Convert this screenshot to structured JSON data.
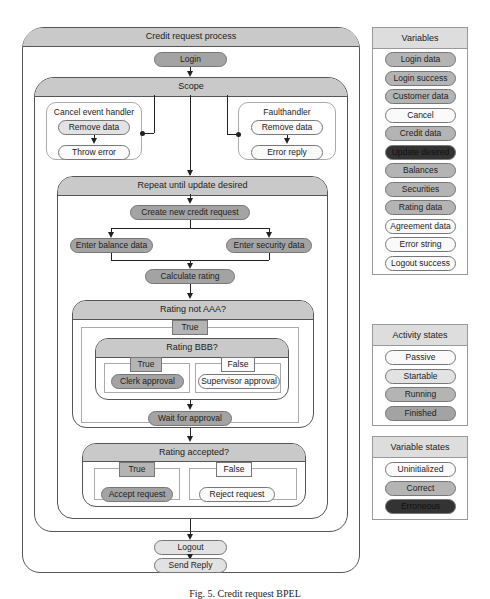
{
  "process": {
    "title": "Credit request process",
    "login": "Login",
    "scope": {
      "title": "Scope",
      "cancel_handler": {
        "title": "Cancel event handler",
        "steps": [
          "Remove data",
          "Throw error"
        ]
      },
      "fault_handler": {
        "title": "Faulthandler",
        "steps": [
          "Remove data",
          "Error reply"
        ]
      },
      "repeat": {
        "title": "Repeat until update desired",
        "create": "Create new credit request",
        "enter_balance": "Enter balance data",
        "enter_security": "Enter security data",
        "calculate": "Calculate rating",
        "rating_not_aaa": {
          "title": "Rating not AAA?",
          "true_label": "True",
          "rating_bbb": {
            "title": "Rating BBB?",
            "true_label": "True",
            "false_label": "False",
            "true_activity": "Clerk approval",
            "false_activity": "Supervisor approval"
          },
          "wait": "Wait for approval"
        },
        "rating_accepted": {
          "title": "Rating accepted?",
          "true_label": "True",
          "false_label": "False",
          "true_activity": "Accept request",
          "false_activity": "Reject request"
        }
      }
    },
    "logout": "Logout",
    "send_reply": "Send Reply"
  },
  "variables": {
    "title": "Variables",
    "items": [
      {
        "label": "Login data",
        "state": "correct"
      },
      {
        "label": "Login success",
        "state": "correct"
      },
      {
        "label": "Customer data",
        "state": "correct"
      },
      {
        "label": "Cancel",
        "state": "uninitialized"
      },
      {
        "label": "Credit data",
        "state": "correct"
      },
      {
        "label": "Update desired",
        "state": "erroneous"
      },
      {
        "label": "Balances",
        "state": "correct"
      },
      {
        "label": "Securities",
        "state": "correct"
      },
      {
        "label": "Rating data",
        "state": "correct"
      },
      {
        "label": "Agreement data",
        "state": "uninitialized"
      },
      {
        "label": "Error string",
        "state": "uninitialized"
      },
      {
        "label": "Logout success",
        "state": "uninitialized"
      }
    ]
  },
  "activity_states": {
    "title": "Activity states",
    "items": [
      "Passive",
      "Startable",
      "Running",
      "Finished"
    ]
  },
  "variable_states": {
    "title": "Variable states",
    "items": [
      "Uninitialized",
      "Correct",
      "Erroneous"
    ]
  },
  "caption": "Fig. 5. Credit request BPEL",
  "colors": {
    "passive": "#fafafa",
    "startable": "#e2e2e2",
    "running": "#b4b4b4",
    "finished": "#a3a3a3",
    "correct": "#b4b4b4",
    "erroneous": "#333333",
    "header": "#c9c9c9"
  }
}
